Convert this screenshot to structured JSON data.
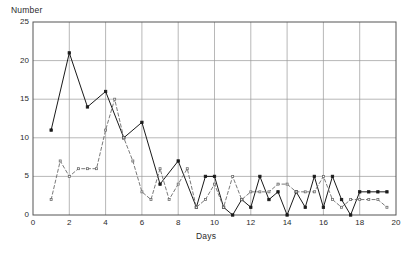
{
  "chart_data": {
    "type": "line",
    "title": "",
    "subtitle": "",
    "xlabel": "Days",
    "ylabel": "Number",
    "xlim": [
      0,
      20
    ],
    "ylim": [
      0,
      25
    ],
    "xticks": [
      0,
      2,
      4,
      6,
      8,
      10,
      12,
      14,
      16,
      18,
      20
    ],
    "yticks": [
      0,
      5,
      10,
      15,
      20,
      25
    ],
    "xtick_labels": [
      "0",
      "2",
      "4",
      "6",
      "8",
      "10",
      "12",
      "14",
      "16",
      "18",
      "20"
    ],
    "ytick_labels": [
      "0",
      "5",
      "10",
      "15",
      "20",
      "25"
    ],
    "grid": true,
    "grid_x": true,
    "grid_y": true,
    "legend": false,
    "legend_position": "none",
    "annotations": [],
    "x": [
      1,
      2,
      3,
      4,
      5,
      6,
      7,
      8,
      9,
      10,
      11,
      12,
      13,
      14,
      15,
      16,
      17,
      18,
      19,
      20
    ],
    "series": [
      {
        "name": "solid-series",
        "style": "solid",
        "marker": "square",
        "color": "#1a1a1a",
        "x": [
          1,
          2,
          3,
          4,
          5,
          6,
          7,
          8,
          9,
          9.5,
          10,
          10.5,
          11,
          11.5,
          12,
          12.5,
          13,
          13.5,
          14,
          14.5,
          15,
          15.5,
          16,
          16.5,
          17,
          17.5,
          18,
          18.5,
          19,
          19.5
        ],
        "values": [
          11,
          21,
          14,
          16,
          10,
          12,
          4,
          7,
          1,
          5,
          5,
          1,
          0,
          2,
          1,
          5,
          2,
          3,
          0,
          3,
          1,
          5,
          1,
          5,
          2,
          0,
          3,
          3,
          3,
          3
        ]
      },
      {
        "name": "dashed-series",
        "style": "dashed",
        "marker": "square",
        "color": "#6b6b6b",
        "x": [
          1,
          1.5,
          2,
          2.5,
          3,
          3.5,
          4,
          4.5,
          5,
          5.5,
          6,
          6.5,
          7,
          7.5,
          8,
          8.5,
          9,
          9.5,
          10,
          10.5,
          11,
          11.5,
          12,
          12.5,
          13,
          13.5,
          14,
          14.5,
          15,
          15.5,
          16,
          16.5,
          17,
          17.5,
          18,
          18.5,
          19,
          19.5
        ],
        "values": [
          2,
          7,
          5,
          6,
          6,
          6,
          11,
          15,
          10,
          7,
          3,
          2,
          6,
          2,
          4,
          6,
          1,
          2,
          4,
          1,
          5,
          2,
          3,
          3,
          3,
          4,
          4,
          3,
          3,
          3,
          5,
          2,
          1,
          2,
          2,
          2,
          2,
          1
        ]
      }
    ]
  },
  "plot": {
    "left": 33,
    "top": 22,
    "right": 396,
    "bottom": 215
  }
}
